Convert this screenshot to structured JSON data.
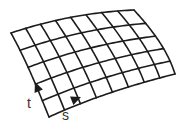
{
  "diagram": {
    "type": "parametric-surface-grid",
    "columns": 8,
    "rows": 5,
    "line_color": "#1c1c1c",
    "corners": {
      "top_left": [
        11,
        33
      ],
      "top_right": [
        134,
        10
      ],
      "bottom_right": [
        175,
        74
      ],
      "bottom_left": [
        49,
        117
      ]
    },
    "edges": {
      "top": [
        [
          11,
          33
        ],
        [
          50,
          20
        ],
        [
          90,
          12
        ],
        [
          134,
          10
        ]
      ],
      "bottom": [
        [
          49,
          117
        ],
        [
          90,
          98
        ],
        [
          135,
          84
        ],
        [
          175,
          74
        ]
      ],
      "left": [
        [
          11,
          33
        ],
        [
          27,
          62
        ],
        [
          38,
          90
        ],
        [
          49,
          117
        ]
      ],
      "right": [
        [
          134,
          10
        ],
        [
          155,
          33
        ],
        [
          168,
          52
        ],
        [
          175,
          74
        ]
      ]
    },
    "labels": {
      "s": {
        "text": "s",
        "x": 62,
        "y": 108
      },
      "t": {
        "text": "t",
        "x": 27,
        "y": 96
      }
    },
    "arrows": {
      "t": {
        "direction": "along-left-edge-up",
        "tip": [
          35,
          82
        ],
        "angle_deg": -112
      },
      "s": {
        "direction": "along-bottom-edge-right",
        "tip": [
          81,
          97
        ],
        "angle_deg": -22
      }
    }
  }
}
